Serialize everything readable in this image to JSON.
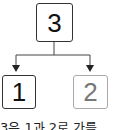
{
  "diagram": {
    "type": "number-decomposition",
    "root": {
      "label": "3"
    },
    "children": [
      {
        "label": "1",
        "style": "dark"
      },
      {
        "label": "2",
        "style": "light"
      }
    ],
    "caption": "3은 1과 2로 가를"
  },
  "colors": {
    "dark_border": "#333333",
    "light_border": "#aaaaaa",
    "light_text": "#777777"
  }
}
